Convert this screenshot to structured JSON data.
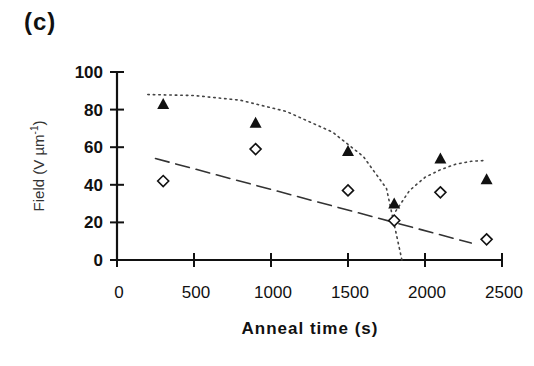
{
  "panel_label": "(c)",
  "chart_data": {
    "type": "scatter",
    "title": "",
    "xlabel": "Anneal time (s)",
    "ylabel": "Field (V µm⁻¹)",
    "ylabel_main": "Field (V µm",
    "ylabel_sup": "-1",
    "ylabel_close": ")",
    "xlim": [
      0,
      2500
    ],
    "ylim": [
      0,
      100
    ],
    "xticks": [
      0,
      500,
      1000,
      1500,
      2000,
      2500
    ],
    "yticks": [
      0,
      20,
      40,
      60,
      80,
      100
    ],
    "grid": false,
    "legend": null,
    "series": [
      {
        "name": "filled-triangle",
        "marker": "triangle-filled",
        "x": [
          300,
          900,
          1500,
          1800,
          2100,
          2400
        ],
        "y": [
          83,
          73,
          58,
          30,
          54,
          43
        ]
      },
      {
        "name": "open-diamond",
        "marker": "diamond-open",
        "x": [
          300,
          900,
          1500,
          1800,
          2100,
          2400
        ],
        "y": [
          42,
          59,
          37,
          21,
          36,
          11
        ]
      }
    ],
    "fit_lines": [
      {
        "name": "dotted-fit-left",
        "style": "dotted",
        "x": [
          200,
          500,
          800,
          1100,
          1400,
          1600,
          1750,
          1850
        ],
        "y": [
          88,
          87.5,
          85,
          79,
          68,
          55,
          38,
          0
        ]
      },
      {
        "name": "dotted-fit-right",
        "style": "dotted",
        "x": [
          1810,
          1900,
          2000,
          2100,
          2200,
          2300,
          2400
        ],
        "y": [
          26,
          37,
          44,
          48,
          51,
          52.5,
          53
        ]
      },
      {
        "name": "dashed-linear-fit",
        "style": "dashed",
        "x": [
          250,
          2300
        ],
        "y": [
          54,
          9
        ]
      }
    ]
  }
}
